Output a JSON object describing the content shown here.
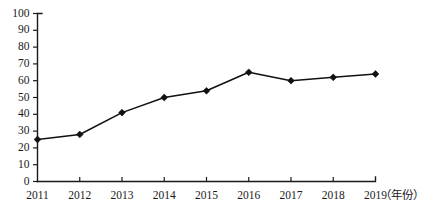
{
  "chart_data": {
    "type": "line",
    "title": "",
    "subtitle": "",
    "xlabel": "（年份）",
    "ylabel": "",
    "categories": [
      "2011",
      "2012",
      "2013",
      "2014",
      "2015",
      "2016",
      "2017",
      "2018",
      "2019"
    ],
    "values": [
      25,
      28,
      41,
      50,
      54,
      65,
      60,
      62,
      64
    ],
    "series": [
      {
        "name": "",
        "values": [
          25,
          28,
          41,
          50,
          54,
          65,
          60,
          62,
          64
        ]
      }
    ],
    "ylim": [
      0,
      100
    ],
    "y_ticks": [
      "0",
      "10",
      "20",
      "30",
      "40",
      "50",
      "60",
      "70",
      "80",
      "90",
      "100"
    ],
    "x_ticks": [
      "2011",
      "2012",
      "2013",
      "2014",
      "2015",
      "2016",
      "2017",
      "2018",
      "2019"
    ],
    "grid": false,
    "legend": null,
    "legend_position": "none",
    "marker": "diamond",
    "line_color": "#111111",
    "marker_color": "#111111",
    "axis_color": "#1a1a1a",
    "background_color": "#ffffff",
    "annotations": []
  }
}
